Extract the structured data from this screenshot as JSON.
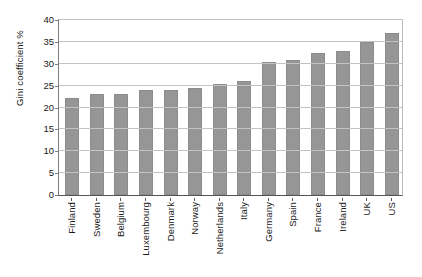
{
  "chart_data": {
    "type": "bar",
    "title": "",
    "xlabel": "",
    "ylabel": "Gini coefficient %",
    "ylim": [
      0,
      40
    ],
    "ytick_values": [
      0,
      5,
      10,
      15,
      20,
      25,
      30,
      35,
      40
    ],
    "ytick_labels": [
      "0",
      "5",
      "10",
      "15",
      "20",
      "25",
      "30",
      "35",
      "40"
    ],
    "grid": true,
    "legend": false,
    "bar_color": "#969696",
    "categories": [
      "Finland",
      "Sweden",
      "Belgium",
      "Luxembourg",
      "Denmark",
      "Norway",
      "Netherlands",
      "Italy",
      "Germany",
      "Spain",
      "France",
      "Ireland",
      "UK",
      "US"
    ],
    "values": [
      22.2,
      23.0,
      23.1,
      23.9,
      24.1,
      24.4,
      25.4,
      26.0,
      30.3,
      30.8,
      32.5,
      33.0,
      35.0,
      37.0
    ]
  }
}
